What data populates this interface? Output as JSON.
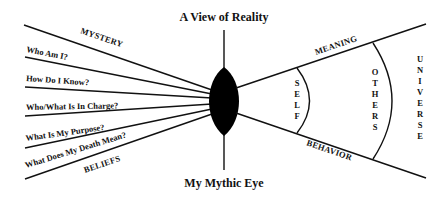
{
  "diagram": {
    "title": "A View of Reality",
    "caption": "My Mythic Eye",
    "left_side": {
      "top_label": "MYSTERY",
      "bottom_label": "BELIEFS",
      "questions": [
        "Who Am I?",
        "How Do I Know?",
        "Who/What Is In Charge?",
        "What Is My Purpose?",
        "What Does My Death Mean?"
      ]
    },
    "right_side": {
      "top_label": "MEANING",
      "bottom_label": "BEHAVIOR",
      "rings": [
        {
          "label": "SELF",
          "letters": [
            "S",
            "E",
            "L",
            "F"
          ]
        },
        {
          "label": "OTHERS",
          "letters": [
            "O",
            "T",
            "H",
            "E",
            "R",
            "S"
          ]
        },
        {
          "label": "UNIVERSE",
          "letters": [
            "U",
            "N",
            "I",
            "V",
            "E",
            "R",
            "S",
            "E"
          ]
        }
      ]
    },
    "center": {
      "shape": "eye-lens",
      "color": "#000000"
    },
    "colors": {
      "ink": "#111111",
      "background": "#ffffff"
    }
  }
}
